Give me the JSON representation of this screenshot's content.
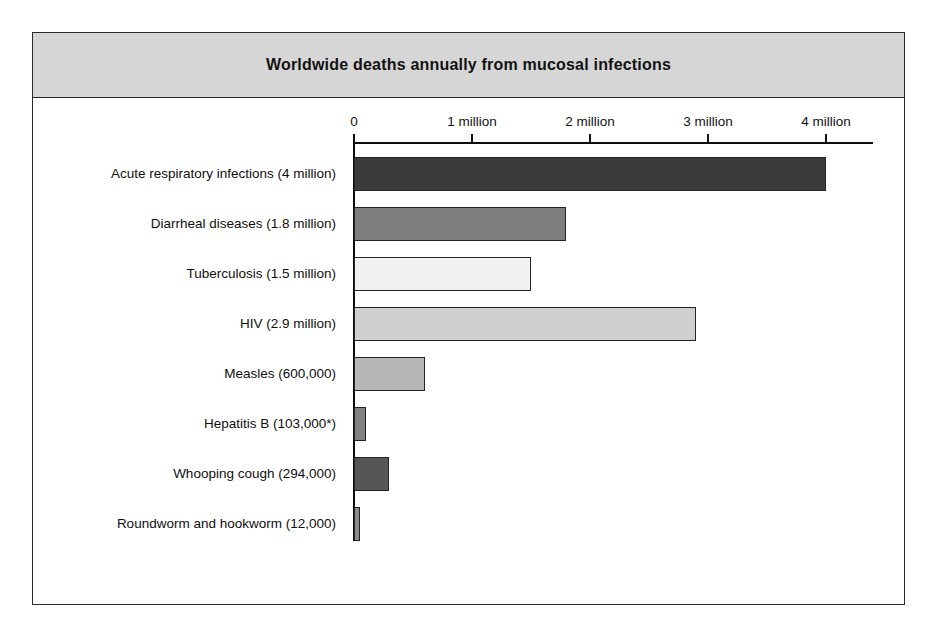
{
  "chart_data": {
    "type": "bar",
    "orientation": "horizontal",
    "title": "Worldwide deaths annually from mucosal infections",
    "xlabel": "",
    "ylabel": "",
    "xlim": [
      0,
      4.4
    ],
    "grid": false,
    "legend": null,
    "unit": "deaths per year",
    "tick_labels": [
      "0",
      "1 million",
      "2 million",
      "3 million",
      "4 million"
    ],
    "tick_values": [
      0,
      1,
      2,
      3,
      4
    ],
    "categories": [
      "Acute respiratory infections (4 million)",
      "Diarrheal diseases (1.8 million)",
      "Tuberculosis (1.5 million)",
      "HIV (2.9 million)",
      "Measles (600,000)",
      "Hepatitis B (103,000*)",
      "Whooping cough (294,000)",
      "Roundworm and hookworm (12,000)"
    ],
    "values": [
      4.0,
      1.8,
      1.5,
      2.9,
      0.6,
      0.103,
      0.294,
      0.012
    ],
    "bar_colors": [
      "#3b3b3b",
      "#7e7e7e",
      "#f1f1f1",
      "#cfcfcf",
      "#b7b7b7",
      "#828282",
      "#565656",
      "#8c8c8c"
    ],
    "bar_edge_color": "#242424",
    "note": "* asterisk appears after the Hepatitis B value"
  },
  "figure": {
    "band_color": "#d6d6d6",
    "frame_color": "#2b2b2b",
    "background": "#ffffff"
  }
}
